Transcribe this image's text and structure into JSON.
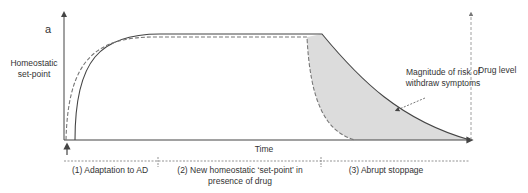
{
  "panel_label": "a",
  "y_axis_left_label": [
    "Homeostatic",
    "set-point"
  ],
  "y_axis_right_label": "Drug level",
  "x_axis_label": "Time",
  "annotation": [
    "Magnitude of risk of",
    "withdraw symptoms"
  ],
  "phases": [
    {
      "label": [
        "(1) Adaptation to AD"
      ]
    },
    {
      "label": [
        "(2) New homeostatic ‘set-point’ in",
        "presence of drug"
      ]
    },
    {
      "label": [
        "(3) Abrupt stoppage"
      ]
    }
  ],
  "legend_series": [
    {
      "name": "Homeostatic set-point",
      "style": "solid"
    },
    {
      "name": "Drug level",
      "style": "dashed"
    }
  ],
  "colors": {
    "line": "#444444",
    "dashed": "#777777",
    "shade": "#dcdcdc",
    "text": "#333333"
  }
}
